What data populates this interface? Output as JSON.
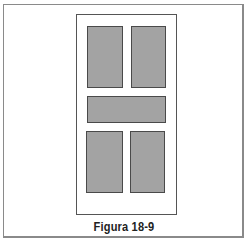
{
  "figure": {
    "caption": "Figura 18-9",
    "colors": {
      "panel_fill": "#a3a3a3",
      "panel_border": "#4a4a4a",
      "door_border": "#555555",
      "frame_border": "#8a8a8a",
      "background": "#ffffff"
    },
    "panels": [
      {
        "name": "top-left-panel",
        "x": 87,
        "y": 26,
        "w": 36,
        "h": 62
      },
      {
        "name": "top-right-panel",
        "x": 131,
        "y": 26,
        "w": 35,
        "h": 62
      },
      {
        "name": "middle-horizontal-panel",
        "x": 87,
        "y": 96,
        "w": 79,
        "h": 27
      },
      {
        "name": "bottom-left-panel",
        "x": 86,
        "y": 131,
        "w": 37,
        "h": 62
      },
      {
        "name": "bottom-right-panel",
        "x": 130,
        "y": 131,
        "w": 35,
        "h": 62
      }
    ]
  }
}
